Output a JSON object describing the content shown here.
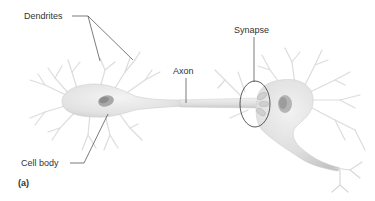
{
  "figure": {
    "panel_label": "(a)",
    "labels": {
      "dendrites": "Dendrites",
      "axon": "Axon",
      "synapse": "Synapse",
      "cell_body": "Cell body"
    }
  },
  "colors": {
    "background": "#ffffff",
    "neuron_fill": "#e6e6e6",
    "neuron_shade": "#c8c8c8",
    "nucleus": "#9a9a9a",
    "dendrite_stroke": "#d8d8d8",
    "leader_line": "#444444",
    "text": "#333333"
  }
}
